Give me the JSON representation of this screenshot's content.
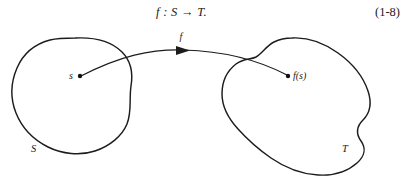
{
  "figure": {
    "equation": {
      "formula": "f : S → T.",
      "number": "(1-8)"
    },
    "domain_set": {
      "set_label": "S",
      "element_label": "s"
    },
    "codomain_set": {
      "set_label": "T",
      "element_label": "f(s)"
    },
    "mapping": {
      "arrow_label": "f"
    },
    "colors": {
      "ink": "#1c1c1c",
      "background": "#ffffff"
    }
  }
}
